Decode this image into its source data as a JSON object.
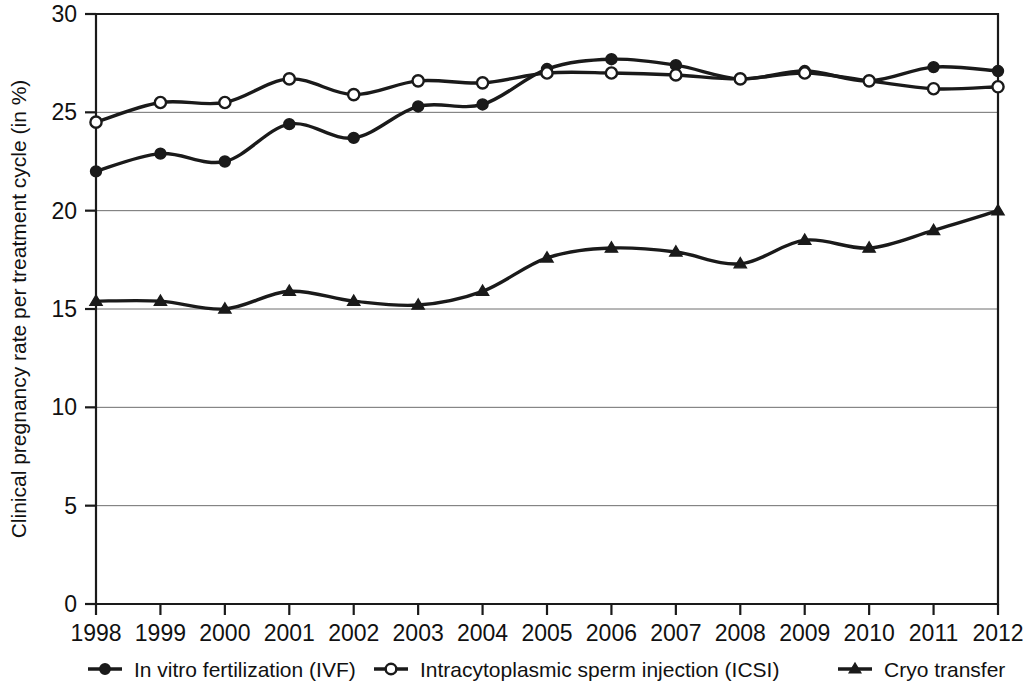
{
  "chart_data": {
    "type": "line",
    "title": "",
    "xlabel": "",
    "ylabel": "Clinical pregnancy rate per treatment cycle (in %)",
    "categories": [
      "1998",
      "1999",
      "2000",
      "2001",
      "2002",
      "2003",
      "2004",
      "2005",
      "2006",
      "2007",
      "2008",
      "2009",
      "2010",
      "2011",
      "2012"
    ],
    "x": [
      1998,
      1999,
      2000,
      2001,
      2002,
      2003,
      2004,
      2005,
      2006,
      2007,
      2008,
      2009,
      2010,
      2011,
      2012
    ],
    "ylim": [
      0,
      30
    ],
    "xlim": [
      1998,
      2012
    ],
    "y_ticks": [
      "0",
      "5",
      "10",
      "15",
      "20",
      "25",
      "30"
    ],
    "y_tick_values": [
      0,
      5,
      10,
      15,
      20,
      25,
      30
    ],
    "grid": "horizontal",
    "legend_position": "bottom",
    "series": [
      {
        "name": "In vitro fertilization (IVF)",
        "marker": "filled-circle",
        "color": "#1a1a1a",
        "values": [
          22.0,
          22.9,
          22.5,
          24.4,
          23.7,
          25.3,
          25.4,
          27.2,
          27.7,
          27.4,
          26.7,
          27.1,
          26.6,
          27.3,
          27.1
        ]
      },
      {
        "name": "Intracytoplasmic sperm injection (ICSI)",
        "marker": "open-circle",
        "color": "#1a1a1a",
        "values": [
          24.5,
          25.5,
          25.5,
          26.7,
          25.9,
          26.6,
          26.5,
          27.0,
          27.0,
          26.9,
          26.7,
          27.0,
          26.6,
          26.2,
          26.3
        ]
      },
      {
        "name": "Cryo transfer",
        "marker": "filled-triangle",
        "color": "#1a1a1a",
        "values": [
          15.4,
          15.4,
          15.0,
          15.9,
          15.4,
          15.2,
          15.9,
          17.6,
          18.1,
          17.9,
          17.3,
          18.5,
          18.1,
          19.0,
          20.0
        ]
      }
    ]
  },
  "legend": {
    "items": [
      {
        "label": "In vitro fertilization (IVF)",
        "marker": "filled-circle"
      },
      {
        "label": "Intracytoplasmic sperm injection (ICSI)",
        "marker": "open-circle"
      },
      {
        "label": "Cryo transfer",
        "marker": "filled-triangle"
      }
    ]
  },
  "colors": {
    "ink": "#1a1a1a",
    "grid": "#6e6e6e",
    "background": "#ffffff"
  }
}
